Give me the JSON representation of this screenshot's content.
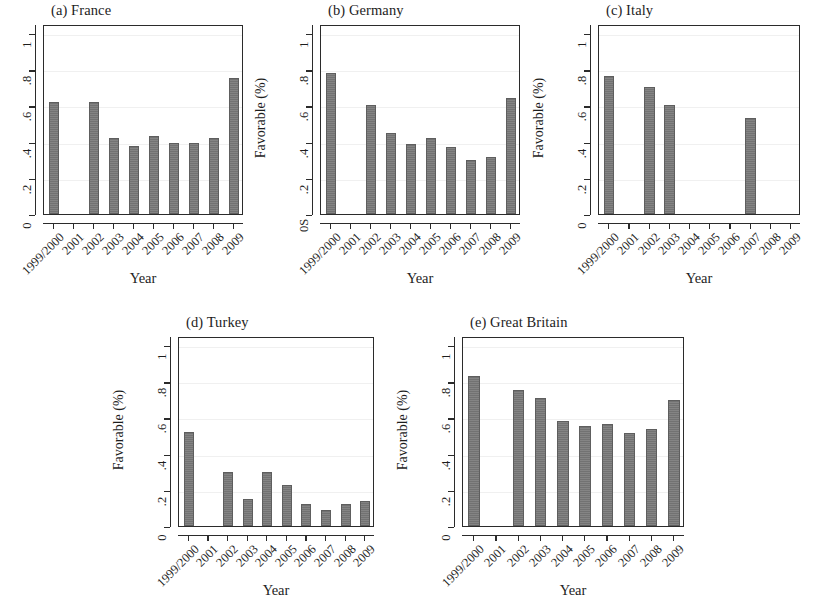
{
  "figure": {
    "background_color": "#ffffff",
    "bar_color": "#767676",
    "axis_color": "#2b2b2b"
  },
  "chart_data": [
    {
      "type": "bar",
      "panel_id": "a",
      "title": "(a) France",
      "xlabel": "Year",
      "ylabel": "Favorable (%)",
      "categories": [
        "1999/2000",
        "2001",
        "2002",
        "2003",
        "2004",
        "2005",
        "2006",
        "2007",
        "2008",
        "2009"
      ],
      "values": [
        0.62,
        null,
        0.62,
        0.42,
        0.375,
        0.43,
        0.39,
        0.39,
        0.42,
        0.75
      ],
      "ylim": [
        0,
        1.05
      ],
      "yticks": [
        0,
        0.2,
        0.4,
        0.6,
        0.8,
        1
      ],
      "ytick_labels": [
        "0",
        ".2",
        ".4",
        ".6",
        ".8",
        "1"
      ],
      "grid": true,
      "legend": "none"
    },
    {
      "type": "bar",
      "panel_id": "b",
      "title": "(b) Germany",
      "xlabel": "Year",
      "ylabel": "Favorable (%)",
      "categories": [
        "1999/2000",
        "2001",
        "2002",
        "2003",
        "2004",
        "2005",
        "2006",
        "2007",
        "2008",
        "2009"
      ],
      "values": [
        0.78,
        null,
        0.6,
        0.45,
        0.385,
        0.42,
        0.37,
        0.3,
        0.315,
        0.64
      ],
      "ylim": [
        0,
        1.05
      ],
      "yticks": [
        0,
        0.2,
        0.4,
        0.6,
        0.8,
        1
      ],
      "ytick_labels": [
        "0S",
        ".2",
        ".4",
        ".6",
        ".8",
        "1"
      ],
      "grid": true,
      "legend": "none"
    },
    {
      "type": "bar",
      "panel_id": "c",
      "title": "(c) Italy",
      "xlabel": "Year",
      "ylabel": "Favorable (%)",
      "categories": [
        "1999/2000",
        "2001",
        "2002",
        "2003",
        "2004",
        "2005",
        "2006",
        "2007",
        "2008",
        "2009"
      ],
      "values": [
        0.76,
        null,
        0.7,
        0.6,
        null,
        null,
        null,
        0.53,
        null,
        null
      ],
      "ylim": [
        0,
        1.05
      ],
      "yticks": [
        0,
        0.2,
        0.4,
        0.6,
        0.8,
        1
      ],
      "ytick_labels": [
        "0",
        ".2",
        ".4",
        ".6",
        ".8",
        "1"
      ],
      "grid": true,
      "legend": "none"
    },
    {
      "type": "bar",
      "panel_id": "d",
      "title": "(d) Turkey",
      "xlabel": "Year",
      "ylabel": "Favorable (%)",
      "categories": [
        "1999/2000",
        "2001",
        "2002",
        "2003",
        "2004",
        "2005",
        "2006",
        "2007",
        "2008",
        "2009"
      ],
      "values": [
        0.52,
        null,
        0.3,
        0.15,
        0.3,
        0.225,
        0.12,
        0.09,
        0.12,
        0.14
      ],
      "ylim": [
        0,
        1.05
      ],
      "yticks": [
        0,
        0.2,
        0.4,
        0.6,
        0.8,
        1
      ],
      "ytick_labels": [
        "0",
        ".2",
        ".4",
        ".6",
        ".8",
        "1"
      ],
      "grid": true,
      "legend": "none"
    },
    {
      "type": "bar",
      "panel_id": "e",
      "title": "(e) Great Britain",
      "xlabel": "Year",
      "ylabel": "Favorable (%)",
      "categories": [
        "1999/2000",
        "2001",
        "2002",
        "2003",
        "2004",
        "2005",
        "2006",
        "2007",
        "2008",
        "2009"
      ],
      "values": [
        0.83,
        null,
        0.75,
        0.705,
        0.58,
        0.555,
        0.565,
        0.515,
        0.535,
        0.695
      ],
      "ylim": [
        0,
        1.05
      ],
      "yticks": [
        0,
        0.2,
        0.4,
        0.6,
        0.8,
        1
      ],
      "ytick_labels": [
        "0",
        ".2",
        ".4",
        ".6",
        ".8",
        "1"
      ],
      "grid": true,
      "legend": "none"
    }
  ],
  "layout": [
    {
      "panel_id": "a",
      "left": 8,
      "top": 2,
      "plot_left": 43,
      "plot_top": 25,
      "plot_w": 200,
      "plot_h": 190
    },
    {
      "panel_id": "b",
      "left": 288,
      "top": 2,
      "plot_left": 320,
      "plot_top": 25,
      "plot_w": 200,
      "plot_h": 190
    },
    {
      "panel_id": "c",
      "left": 553,
      "top": 2,
      "plot_left": 598,
      "plot_top": 25,
      "plot_w": 202,
      "plot_h": 190
    },
    {
      "panel_id": "d",
      "left": 148,
      "top": 314,
      "plot_left": 178,
      "plot_top": 337,
      "plot_w": 196,
      "plot_h": 190
    },
    {
      "panel_id": "e",
      "left": 455,
      "top": 314,
      "plot_left": 462,
      "plot_top": 337,
      "plot_w": 222,
      "plot_h": 190
    }
  ]
}
